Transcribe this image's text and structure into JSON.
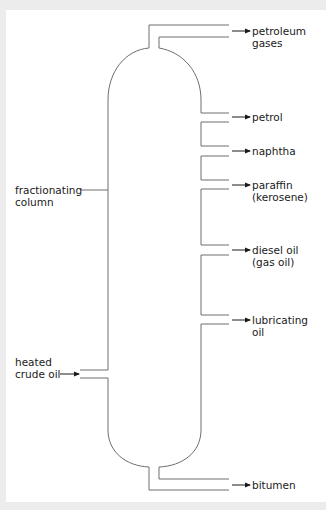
{
  "diagram": {
    "colors": {
      "background": "#ececec",
      "panel": "#ffffff",
      "line": "#6e6e6e",
      "arrow": "#1a1a1a",
      "text": "#1a1a1a"
    },
    "left_labels": {
      "column": {
        "line1": "fractionating",
        "line2": "column"
      },
      "input": {
        "line1": "heated",
        "line2": "crude oil"
      }
    },
    "fractions": [
      {
        "line1": "petroleum",
        "line2": "gases"
      },
      {
        "line1": "petrol",
        "line2": ""
      },
      {
        "line1": "naphtha",
        "line2": ""
      },
      {
        "line1": "paraffin",
        "line2": "(kerosene)"
      },
      {
        "line1": "diesel oil",
        "line2": "(gas oil)"
      },
      {
        "line1": "lubricating",
        "line2": "oil"
      },
      {
        "line1": "bitumen",
        "line2": ""
      }
    ]
  }
}
